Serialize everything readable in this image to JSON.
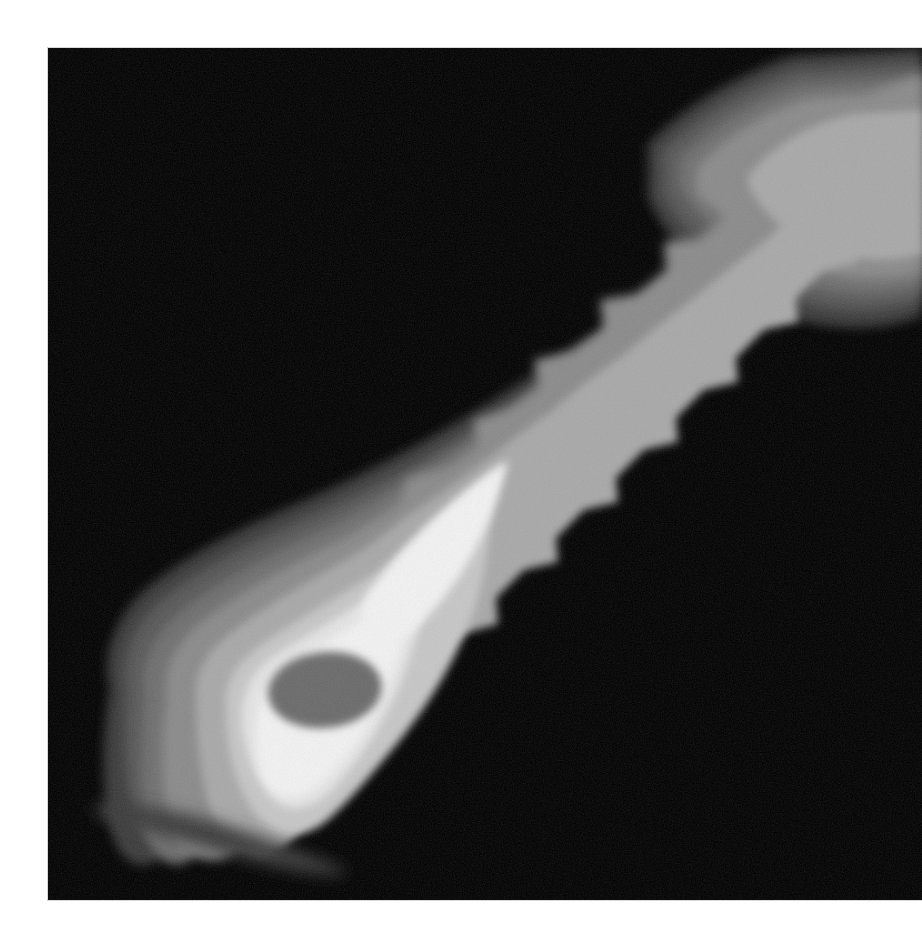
{
  "figure": {
    "title": "Radio jet intensity map",
    "alt_text": "Grayscale contour-banded image of an astrophysical jet extending from a bright core at lower-left toward the upper-right corner",
    "page_background": "#ffffff",
    "panel_background": "#000000",
    "panel": {
      "x": 48,
      "y": 48,
      "width": 874,
      "height": 852
    }
  },
  "chart_data": {
    "type": "heatmap",
    "title": "Radio jet intensity map",
    "subtitle": "",
    "xlabel": "",
    "ylabel": "",
    "xlim": [
      0,
      874
    ],
    "ylim": [
      0,
      852
    ],
    "grid": false,
    "legend_position": "none",
    "colormap": "grayscale-discrete",
    "rendering": "filled contour bands",
    "background_level_value": 0,
    "levels": [
      {
        "index": 0,
        "label": "background",
        "color": "#000000",
        "value": 0
      },
      {
        "index": 1,
        "label": "level 1",
        "color": "#3a3a3a",
        "value": 1
      },
      {
        "index": 2,
        "label": "level 2",
        "color": "#565656",
        "value": 2
      },
      {
        "index": 3,
        "label": "level 3",
        "color": "#6e6e6e",
        "value": 3
      },
      {
        "index": 4,
        "label": "level 4",
        "color": "#8a8a8a",
        "value": 4
      },
      {
        "index": 5,
        "label": "level 5",
        "color": "#a8a8a8",
        "value": 5
      },
      {
        "index": 6,
        "label": "level 6",
        "color": "#c6c6c6",
        "value": 6
      },
      {
        "index": 7,
        "label": "level 7",
        "color": "#e4e4e4",
        "value": 7
      },
      {
        "index": 8,
        "label": "peak (saturated)",
        "color": "#f2f2f2",
        "value": 8
      },
      {
        "index": 9,
        "label": "core hole",
        "color": "#6a6a6a",
        "value": 9
      }
    ],
    "features": [
      {
        "name": "core",
        "center_x": 300,
        "center_y": 640,
        "peak_level": 8,
        "note": "brightest knot with dark saturated centre"
      },
      {
        "name": "core-hole",
        "center_x": 277,
        "center_y": 642,
        "rx": 57,
        "ry": 38,
        "level": 9,
        "note": "dark ellipse inside the core"
      },
      {
        "name": "inner-knot",
        "center_x": 478,
        "center_y": 448,
        "rx": 42,
        "ry": 24,
        "level": 5,
        "note": "small isolated bright oval along the jet"
      },
      {
        "name": "jet-ridge",
        "level": 4,
        "note": "zig-zag ridge running from core to upper-right"
      },
      {
        "name": "outer-knot",
        "center_x": 800,
        "center_y": 130,
        "rx": 68,
        "ry": 52,
        "level": 5,
        "note": "bright knot near upper-right corner"
      },
      {
        "name": "beam-streak",
        "center_x": 150,
        "center_y": 780,
        "level": 1,
        "note": "thin elongated low-level streak below the core"
      }
    ],
    "axis_ticks_visible": false,
    "colorbar_visible": false
  }
}
